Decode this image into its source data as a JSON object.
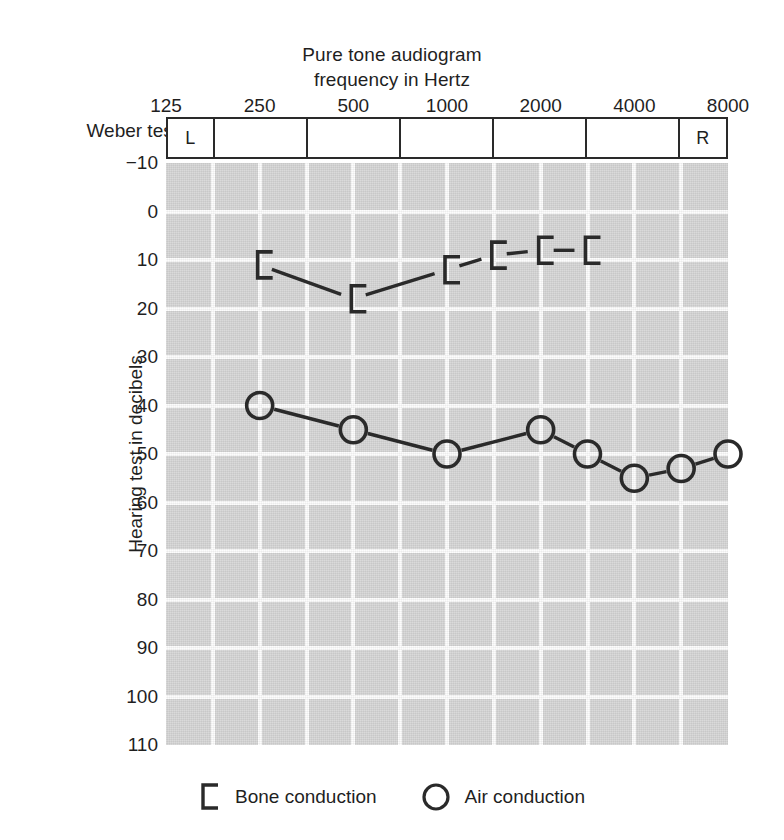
{
  "chart_data": {
    "type": "line",
    "title": "Pure tone audiogram frequency in Hertz",
    "title_line1": "Pure tone audiogram",
    "title_line2": "frequency in Hertz",
    "xlabel": "frequency in Hertz",
    "ylabel": "Hearing test in decibels",
    "x_ticks": [
      "125",
      "250",
      "500",
      "1000",
      "2000",
      "4000",
      "8000"
    ],
    "x_tick_values": [
      125,
      250,
      500,
      1000,
      2000,
      4000,
      8000
    ],
    "x_scale": "log2-octave",
    "xlim": [
      125,
      8000
    ],
    "y_ticks": [
      "-10",
      "0",
      "10",
      "20",
      "30",
      "40",
      "50",
      "60",
      "70",
      "80",
      "90",
      "100",
      "110"
    ],
    "y_tick_values": [
      -10,
      0,
      10,
      20,
      30,
      40,
      50,
      60,
      70,
      80,
      90,
      100,
      110
    ],
    "ylim": [
      -10,
      110
    ],
    "y_inverted": true,
    "grid": true,
    "grid_columns": 12,
    "grid_rows": 12,
    "legend_position": "bottom",
    "series": [
      {
        "name": "Bone conduction",
        "marker": "bracket-left",
        "values": [
          {
            "freq": 250,
            "db": 11
          },
          {
            "freq": 500,
            "db": 18
          },
          {
            "freq": 1000,
            "db": 12
          },
          {
            "freq": 1414,
            "db": 9
          },
          {
            "freq": 2000,
            "db": 8
          },
          {
            "freq": 2828,
            "db": 8
          }
        ]
      },
      {
        "name": "Air conduction",
        "marker": "circle",
        "values": [
          {
            "freq": 250,
            "db": 40
          },
          {
            "freq": 500,
            "db": 45
          },
          {
            "freq": 1000,
            "db": 50
          },
          {
            "freq": 2000,
            "db": 45
          },
          {
            "freq": 2828,
            "db": 50
          },
          {
            "freq": 4000,
            "db": 55
          },
          {
            "freq": 5657,
            "db": 53
          },
          {
            "freq": 8000,
            "db": 50
          }
        ]
      }
    ],
    "annotations": {
      "weber_test_label": "Weber test",
      "weber_cells": [
        "L",
        "",
        "",
        "",
        "",
        "",
        "R"
      ]
    },
    "colors": {
      "plot_background": "#d6d6d6",
      "gridline": "#fdfdfd",
      "marker": "#2a2a2a",
      "text": "#1f1f1f",
      "page_background": "#ffffff"
    }
  },
  "legend": {
    "bone": "Bone conduction",
    "air": "Air conduction"
  }
}
